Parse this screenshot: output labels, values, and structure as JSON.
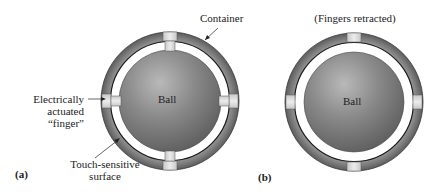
{
  "figure_a": {
    "panel_label": "(a)",
    "labels": {
      "container": "Container",
      "finger_line1": "Electrically",
      "finger_line2": "actuated",
      "finger_line3": "“finger”",
      "touch_line1": "Touch-sensitive",
      "touch_line2": "surface",
      "ball": "Ball"
    },
    "state": "fingers extended"
  },
  "figure_b": {
    "panel_label": "(b)",
    "title": "(Fingers retracted)",
    "labels": {
      "ball": "Ball"
    },
    "state": "fingers retracted"
  },
  "colors": {
    "ring": "#8a8a8a",
    "ring_dark": "#5e5e5e",
    "ball": "#7a7a7a",
    "ball_highlight": "#b8b8b8",
    "finger": "#d9d9d9",
    "gap": "#ffffff",
    "outline": "#1a1a1a"
  }
}
